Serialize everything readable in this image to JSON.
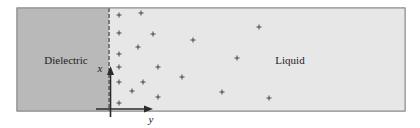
{
  "diagram": {
    "regions": {
      "dielectric": {
        "label": "Dielectric",
        "color": "#b9b9b9"
      },
      "liquid": {
        "label": "Liquid",
        "color": "#e7e7e7"
      }
    },
    "boundary": {
      "style": "dashed",
      "color": "#7a7a7a"
    },
    "axes": {
      "x_label": "x",
      "y_label": "y",
      "color": "#2a2a2a"
    },
    "charges": {
      "symbol": "+",
      "count": 19,
      "positions": [
        [
          119,
          15
        ],
        [
          141,
          13
        ],
        [
          119,
          33
        ],
        [
          153,
          34
        ],
        [
          193,
          40
        ],
        [
          138,
          47
        ],
        [
          119,
          54
        ],
        [
          119,
          67
        ],
        [
          158,
          67
        ],
        [
          182,
          77
        ],
        [
          119,
          82
        ],
        [
          143,
          82
        ],
        [
          132,
          91
        ],
        [
          158,
          97
        ],
        [
          119,
          103
        ],
        [
          259,
          27
        ],
        [
          237,
          58
        ],
        [
          222,
          92
        ],
        [
          269,
          98
        ]
      ]
    }
  }
}
